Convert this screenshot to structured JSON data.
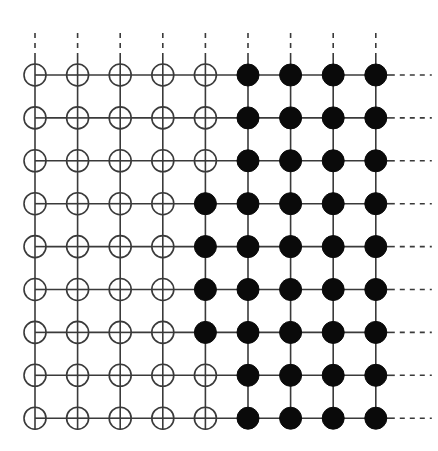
{
  "diagram": {
    "type": "lattice-grid",
    "rows": 9,
    "cols": 9,
    "origin": {
      "x": 35,
      "y": 75
    },
    "spacing": {
      "x": 42.6,
      "y": 42.9
    },
    "node_radius": 11,
    "colors": {
      "line": "#3a3a3a",
      "open_fill": "#ffffff",
      "filled_fill": "#0a0a0a"
    },
    "legend": {
      "open": "open circle (empty node)",
      "filled": "filled circle (occupied node)"
    },
    "filled_pattern": [
      [
        0,
        0,
        0,
        0,
        0,
        1,
        1,
        1,
        1
      ],
      [
        0,
        0,
        0,
        0,
        0,
        1,
        1,
        1,
        1
      ],
      [
        0,
        0,
        0,
        0,
        0,
        1,
        1,
        1,
        1
      ],
      [
        0,
        0,
        0,
        0,
        1,
        1,
        1,
        1,
        1
      ],
      [
        0,
        0,
        0,
        0,
        1,
        1,
        1,
        1,
        1
      ],
      [
        0,
        0,
        0,
        0,
        1,
        1,
        1,
        1,
        1
      ],
      [
        0,
        0,
        0,
        0,
        1,
        1,
        1,
        1,
        1
      ],
      [
        0,
        0,
        0,
        0,
        0,
        1,
        1,
        1,
        1
      ],
      [
        0,
        0,
        0,
        0,
        0,
        1,
        1,
        1,
        1
      ]
    ],
    "continuation": {
      "top": "dashed lines extend upward from each column",
      "right": "dashed lines extend rightward from each row"
    }
  }
}
